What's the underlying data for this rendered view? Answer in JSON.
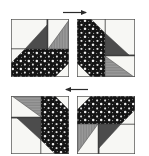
{
  "diagram": {
    "type": "quilt-block-assembly-diagram",
    "background_color": "#ffffff",
    "canvas": {
      "width": 149,
      "height": 156
    },
    "fabrics": [
      {
        "key": "white",
        "label": "White / background",
        "color": "#f7f7f4",
        "pattern": "solid"
      },
      {
        "key": "dark_gray",
        "label": "Dark gray solid",
        "color": "#4c4c4c",
        "pattern": "solid"
      },
      {
        "key": "gray_stripe",
        "label": "Gray vertical stripe",
        "color": "#9a9a9a",
        "pattern": "vertical-stripes"
      },
      {
        "key": "black_dot",
        "label": "Black with white dots",
        "color": "#141414",
        "pattern": "polka-dots"
      }
    ],
    "outline_color": "#4a4a4a",
    "arrow_color": "#2b2b2b",
    "blocks": [
      {
        "name": "block-top-left",
        "position": "top-left",
        "rotation_deg": 0,
        "x": 11,
        "y": 19,
        "size": 58,
        "patches": [
          "white",
          "gray_stripe",
          "dark_gray",
          "black_dot"
        ]
      },
      {
        "name": "block-top-right",
        "position": "top-right",
        "rotation_deg": 90,
        "x": 77,
        "y": 19,
        "size": 58,
        "patches": [
          "white",
          "gray_stripe",
          "dark_gray",
          "black_dot"
        ]
      },
      {
        "name": "block-bottom-left",
        "position": "bottom-left",
        "rotation_deg": 270,
        "x": 11,
        "y": 96,
        "size": 58,
        "patches": [
          "white",
          "gray_stripe",
          "dark_gray",
          "black_dot"
        ]
      },
      {
        "name": "block-bottom-right",
        "position": "bottom-right",
        "rotation_deg": 180,
        "x": 77,
        "y": 96,
        "size": 58,
        "patches": [
          "white",
          "gray_stripe",
          "dark_gray",
          "black_dot"
        ]
      }
    ],
    "arrows": [
      {
        "name": "arrow-top",
        "direction": "right",
        "x1": 62,
        "x2": 90,
        "y": 12
      },
      {
        "name": "arrow-middle",
        "direction": "left",
        "x1": 62,
        "x2": 90,
        "y": 89
      }
    ]
  }
}
